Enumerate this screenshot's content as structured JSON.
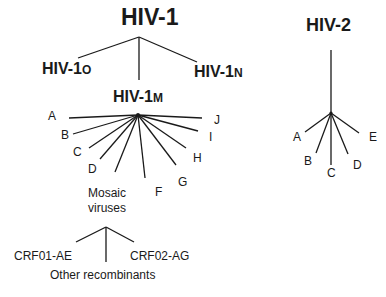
{
  "diagram": {
    "type": "phylogenetic-tree",
    "line_color": "#1a1a1a",
    "hiv1": {
      "title": "HIV-1",
      "groups": {
        "o": {
          "prefix": "HIV-1",
          "suffix": "O"
        },
        "n": {
          "prefix": "HIV-1",
          "suffix": "N"
        },
        "m": {
          "prefix": "HIV-1",
          "suffix": "M"
        }
      },
      "m_subtypes": [
        "A",
        "B",
        "C",
        "D",
        "F",
        "G",
        "H",
        "I",
        "J"
      ],
      "mosaic": {
        "line1": "Mosaic",
        "line2": "viruses",
        "recombinants": [
          "CRF01-AE",
          "Other recombinants",
          "CRF02-AG"
        ]
      }
    },
    "hiv2": {
      "title": "HIV-2",
      "subtypes": [
        "A",
        "B",
        "C",
        "D",
        "E"
      ]
    }
  }
}
